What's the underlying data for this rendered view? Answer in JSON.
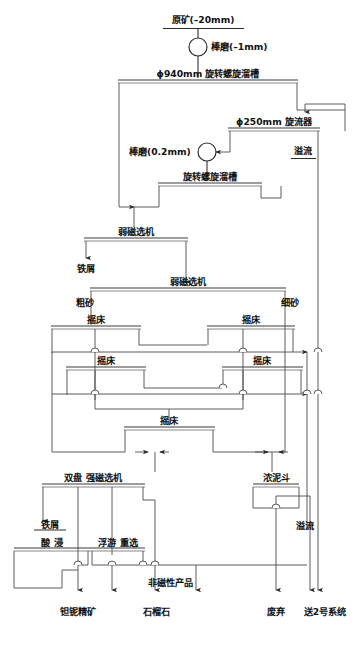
{
  "diagram": {
    "type": "process-flowsheet",
    "width": 357,
    "height": 645,
    "line_color": "#4a4a4a",
    "text_color": "#111111",
    "background": "#ffffff"
  },
  "nodes": {
    "feed": {
      "label": "原矿(–20mm)",
      "kind": "stream-header"
    },
    "rod_mill_1": {
      "label": "棒磨(–1mm)",
      "kind": "mill-circle"
    },
    "spiral_chute_1": {
      "label": "ϕ940mm 旋转螺旋溜槽",
      "kind": "unit-bar"
    },
    "cyclone": {
      "label": "ϕ250mm 旋流器",
      "kind": "unit-bar"
    },
    "rod_mill_2": {
      "label": "棒磨(0.2mm)",
      "kind": "mill-circle"
    },
    "spiral_chute_2": {
      "label": "旋转螺旋溜槽",
      "kind": "unit-bar"
    },
    "lims_1": {
      "label": "弱磁选机",
      "kind": "unit-bar"
    },
    "lims_2": {
      "label": "弱磁选机",
      "kind": "unit-bar"
    },
    "table_1": {
      "label": "摇床",
      "kind": "unit-bar"
    },
    "table_2": {
      "label": "摇床",
      "kind": "unit-bar"
    },
    "table_3": {
      "label": "摇床",
      "kind": "unit-bar"
    },
    "table_4": {
      "label": "摇床",
      "kind": "unit-bar"
    },
    "table_5": {
      "label": "摇床",
      "kind": "unit-bar"
    },
    "dual_disc_hims": {
      "label": "双盘 强磁选机",
      "kind": "unit-bar"
    },
    "thickener_cone": {
      "label": "浓泥斗",
      "kind": "hopper"
    },
    "acid_leach": {
      "label": "酸 浸",
      "kind": "unit-bar"
    },
    "float_gravity": {
      "label": "浮游 重选",
      "kind": "unit-bar"
    }
  },
  "stream_labels": {
    "overflow_top": "溢流",
    "iron_scrap_1": "铁屑",
    "coarse_sand": "粗砂",
    "fine_sand": "细砂",
    "iron_scrap_2": "铁屑",
    "overflow_bottom": "溢流",
    "nonmagnetic_product": "非磁性产品"
  },
  "products": {
    "ta_nb_concentrate": "钽铌精矿",
    "garnet": "石榴石",
    "discard": "废弃",
    "to_system_2": "送2号系统"
  }
}
